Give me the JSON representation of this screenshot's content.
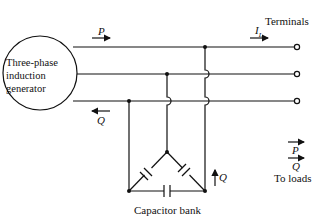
{
  "diagram": {
    "type": "circuit",
    "generator_label_lines": [
      "Three-phase",
      "induction",
      "generator"
    ],
    "labels": {
      "terminals": "Terminals",
      "current": "I",
      "current_sub": "L",
      "p_top": "P",
      "q_return": "Q",
      "q_cap": "Q",
      "p_load": "P",
      "q_load": "Q",
      "to_loads": "To loads",
      "capacitor_bank": "Capacitor bank"
    },
    "phases": 3,
    "components": [
      "three-phase induction generator",
      "delta-connected capacitor bank",
      "terminals to loads"
    ],
    "line_color": "#111111"
  }
}
